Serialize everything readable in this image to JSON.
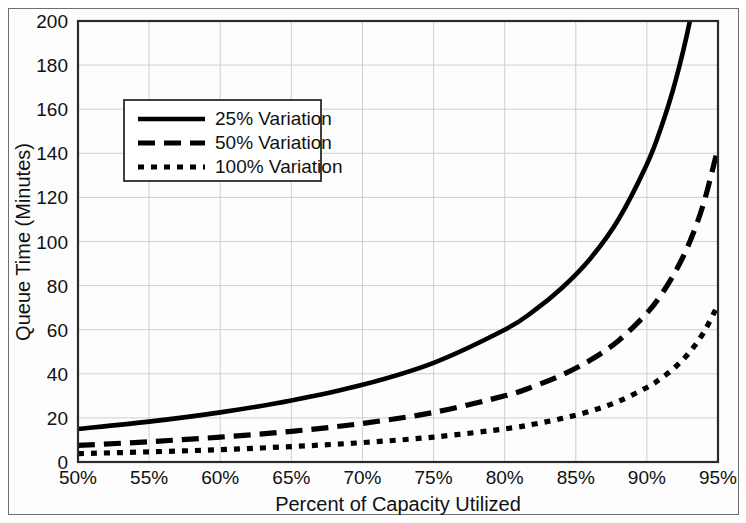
{
  "figure": {
    "background": "#ffffff",
    "frame_color": "#6f6f6f",
    "axis_color": "#2b2b2b",
    "grid_color": "#c9c9c9",
    "curve_color": "#000000"
  },
  "chart_data": {
    "type": "line",
    "title": "",
    "xlabel": "Percent of Capacity Utilized",
    "ylabel": "Queue Time (Minutes)",
    "xlim": [
      50,
      95
    ],
    "ylim": [
      0,
      200
    ],
    "grid": true,
    "legend_position": "upper-left-inside",
    "x_tick_labels": [
      "50%",
      "55%",
      "60%",
      "65%",
      "70%",
      "75%",
      "80%",
      "85%",
      "90%",
      "95%"
    ],
    "x_ticks": [
      50,
      55,
      60,
      65,
      70,
      75,
      80,
      85,
      90,
      95
    ],
    "y_tick_labels": [
      "0",
      "20",
      "40",
      "60",
      "80",
      "100",
      "120",
      "140",
      "160",
      "180",
      "200"
    ],
    "y_ticks": [
      0,
      20,
      40,
      60,
      80,
      100,
      120,
      140,
      160,
      180,
      200
    ],
    "x": [
      50,
      55,
      60,
      65,
      70,
      75,
      80,
      82,
      84,
      86,
      88,
      90,
      91,
      92,
      93,
      94,
      95
    ],
    "series": [
      {
        "name": "25% Variation",
        "dash": "solid",
        "stroke_width": 4.6,
        "dasharray": "",
        "values": [
          15.0,
          18.3,
          22.5,
          27.9,
          35.0,
          45.0,
          60.0,
          68.3,
          78.8,
          92.1,
          110.0,
          135.0,
          151.7,
          172.5,
          199.3,
          235.0,
          285.0
        ]
      },
      {
        "name": "50% Variation",
        "dash": "dashed",
        "stroke_width": 5.2,
        "dasharray": "17,9",
        "values": [
          7.5,
          9.2,
          11.3,
          13.9,
          17.5,
          22.5,
          30.0,
          34.2,
          39.4,
          46.1,
          55.0,
          67.5,
          75.8,
          86.3,
          99.6,
          117.5,
          142.5
        ]
      },
      {
        "name": "100% Variation",
        "dash": "dotted",
        "stroke_width": 5.2,
        "dasharray": "6,7",
        "values": [
          3.8,
          4.6,
          5.6,
          7.0,
          8.8,
          11.3,
          15.0,
          17.1,
          19.7,
          23.0,
          27.5,
          33.8,
          37.9,
          43.1,
          49.8,
          58.8,
          71.3
        ]
      }
    ],
    "legend_entries": [
      {
        "label": "25% Variation",
        "dash": "solid"
      },
      {
        "label": "50% Variation",
        "dash": "dashed"
      },
      {
        "label": "100% Variation",
        "dash": "dotted"
      }
    ]
  }
}
